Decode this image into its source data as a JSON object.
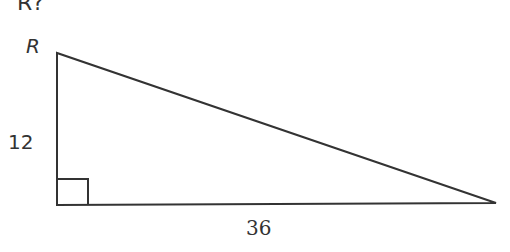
{
  "question_fragment": "R?",
  "diagram": {
    "type": "right-triangle",
    "vertex_label": "R",
    "side_vertical_label": "12",
    "side_horizontal_label": "36",
    "right_angle_marker": true,
    "stroke_color": "#333333"
  }
}
